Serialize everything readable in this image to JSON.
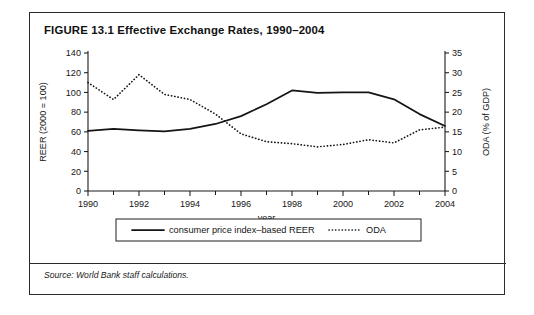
{
  "figure": {
    "title": "FIGURE 13.1  Effective Exchange Rates, 1990–2004",
    "source": "Source: World Bank staff calculations."
  },
  "chart_data": {
    "type": "line",
    "title": "Effective Exchange Rates, 1990–2004",
    "xlabel": "year",
    "x": [
      1990,
      1991,
      1992,
      1993,
      1994,
      1995,
      1996,
      1997,
      1998,
      1999,
      2000,
      2001,
      2002,
      2003,
      2004
    ],
    "xlim": [
      1990,
      2004
    ],
    "xtick_labels": [
      "1990",
      "1992",
      "1994",
      "1996",
      "1998",
      "2000",
      "2002",
      "2004"
    ],
    "xtick_values": [
      1990,
      1992,
      1994,
      1996,
      1998,
      2000,
      2002,
      2004
    ],
    "xtick_minor_values": [
      1991,
      1993,
      1995,
      1997,
      1999,
      2001,
      2003
    ],
    "grid": false,
    "legend_position": "below",
    "left_axis": {
      "label": "REER (2000 = 100)",
      "ylim": [
        0,
        140
      ],
      "ticks": [
        0,
        20,
        40,
        60,
        80,
        100,
        120,
        140
      ]
    },
    "right_axis": {
      "label": "ODA (% of GDP)",
      "ylim": [
        0,
        35
      ],
      "ticks": [
        0,
        5,
        10,
        15,
        20,
        25,
        30,
        35
      ]
    },
    "series": [
      {
        "name": "consumer price index–based REER",
        "axis": "left",
        "style": "solid",
        "values": [
          61,
          63,
          61.5,
          60.5,
          63,
          68,
          76,
          88,
          102,
          99.5,
          100,
          100,
          93,
          78,
          66
        ]
      },
      {
        "name": "ODA",
        "axis": "right",
        "style": "dotted",
        "values": [
          27.5,
          23.2,
          29.5,
          24.5,
          23.2,
          19.5,
          14.5,
          12.5,
          12,
          11.2,
          11.8,
          13,
          12.2,
          15.5,
          16.2
        ]
      }
    ]
  },
  "legend": {
    "entries": [
      {
        "label": "consumer price index–based REER",
        "style": "solid"
      },
      {
        "label": "ODA",
        "style": "dotted"
      }
    ]
  }
}
